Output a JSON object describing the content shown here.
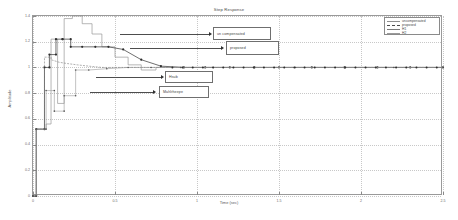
{
  "chart_data": {
    "type": "line",
    "title": "Step Response",
    "xlabel": "Time (sec)",
    "ylabel": "Amplitude",
    "xlim": [
      0,
      2.5
    ],
    "ylim": [
      0,
      1.4
    ],
    "grid": true,
    "xticks": [
      "0",
      "0.5",
      "1",
      "1.5",
      "2",
      "2.5"
    ],
    "xtick_values": [
      0,
      0.5,
      1,
      1.5,
      2,
      2.5
    ],
    "yticks": [
      "0",
      "0.2",
      "0.4",
      "0.6",
      "0.8",
      "1",
      "1.2",
      "1.4"
    ],
    "ytick_values": [
      0,
      0.2,
      0.4,
      0.6,
      0.8,
      1.0,
      1.2,
      1.4
    ],
    "legend_position": "top-right",
    "series": [
      {
        "name": "uncompensated",
        "style": "solid",
        "color": "#8f8f8f",
        "x": [
          0,
          0.02,
          0.02,
          0.08,
          0.08,
          0.11,
          0.11,
          0.15,
          0.15,
          0.19,
          0.19,
          0.24,
          0.24,
          0.3,
          0.3,
          0.36,
          0.36,
          0.42,
          0.42,
          0.5,
          0.5,
          0.58,
          0.58,
          0.66,
          0.66,
          0.75,
          0.75,
          2.5
        ],
        "y": [
          0,
          0,
          0.52,
          0.52,
          0.56,
          0.56,
          1.22,
          1.22,
          0.72,
          0.72,
          1.38,
          1.38,
          1.4,
          1.4,
          1.34,
          1.34,
          1.26,
          1.26,
          1.16,
          1.16,
          1.08,
          1.08,
          1.02,
          1.02,
          0.98,
          0.98,
          1.0,
          1.0
        ]
      },
      {
        "name": "proposed",
        "style": "dashed-marker",
        "color": "#4a4a4a",
        "x": [
          0,
          0.02,
          0.02,
          0.07,
          0.07,
          0.1,
          0.1,
          0.14,
          0.14,
          0.18,
          0.18,
          0.23,
          0.23,
          0.3,
          0.38,
          0.46,
          0.55,
          0.66,
          0.78,
          0.92,
          1.05,
          1.2,
          1.35,
          1.5,
          1.7,
          1.9,
          2.1,
          2.3,
          2.5
        ],
        "y": [
          0,
          0,
          0.52,
          0.52,
          1.0,
          1.0,
          1.1,
          1.1,
          1.22,
          1.22,
          1.22,
          1.22,
          1.16,
          1.16,
          1.16,
          1.16,
          1.14,
          1.06,
          1.01,
          1.0,
          1.0,
          1.0,
          1.0,
          1.0,
          1.0,
          1.0,
          1.0,
          1.0,
          1.0
        ]
      },
      {
        "name": "H1",
        "style": "solid",
        "color": "#7a7a7a",
        "x": [
          0,
          0.02,
          0.02,
          0.07,
          0.07,
          0.11,
          0.11,
          0.16,
          0.21,
          0.27,
          0.34,
          0.42,
          0.52,
          0.64,
          0.78,
          0.95,
          1.15,
          1.4,
          1.7,
          2.0,
          2.5
        ],
        "y": [
          0,
          0,
          0.52,
          0.52,
          1.08,
          1.08,
          1.06,
          1.04,
          1.03,
          1.02,
          1.01,
          1.0,
          1.0,
          1.0,
          1.0,
          1.0,
          1.0,
          1.0,
          1.0,
          1.0,
          1.0
        ]
      },
      {
        "name": "H2",
        "style": "solid",
        "color": "#9a9a9a",
        "x": [
          0,
          0.02,
          0.02,
          0.08,
          0.08,
          0.13,
          0.13,
          0.19,
          0.19,
          0.26,
          0.26,
          0.34,
          0.45,
          0.58,
          0.72,
          0.9,
          1.1,
          1.35,
          1.6,
          1.9,
          2.2,
          2.5
        ],
        "y": [
          0,
          0,
          0.52,
          0.52,
          0.82,
          0.82,
          0.66,
          0.66,
          0.78,
          0.78,
          0.98,
          0.98,
          0.99,
          1.0,
          1.0,
          1.0,
          1.0,
          1.0,
          1.0,
          1.0,
          1.0,
          1.0
        ]
      }
    ],
    "annotations": [
      {
        "text": "un compensated",
        "target_series": "uncompensated"
      },
      {
        "text": "proposed",
        "target_series": "proposed"
      },
      {
        "text": "Hsub",
        "target_series": "H1"
      },
      {
        "text": "Mahlrheepe",
        "target_series": "H2"
      }
    ]
  },
  "legend": {
    "entries": [
      {
        "label": "uncompensated"
      },
      {
        "label": "proposed"
      },
      {
        "label": "H1"
      },
      {
        "label": "H2"
      }
    ]
  }
}
